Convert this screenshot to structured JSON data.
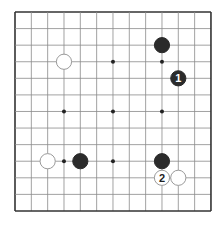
{
  "board": {
    "size": 13,
    "origin_x": 15,
    "origin_y": 12,
    "spacing_x": 16.33,
    "spacing_y": 16.58,
    "line_color": "#8a8a8a",
    "border_color": "#333333",
    "star_points": [
      [
        3,
        3
      ],
      [
        6,
        3
      ],
      [
        9,
        3
      ],
      [
        3,
        6
      ],
      [
        6,
        6
      ],
      [
        9,
        6
      ],
      [
        3,
        9
      ],
      [
        6,
        9
      ],
      [
        9,
        9
      ]
    ]
  },
  "stones": [
    {
      "color": "black",
      "col": 9,
      "row": 2,
      "label": ""
    },
    {
      "color": "black",
      "col": 10,
      "row": 4,
      "label": "1"
    },
    {
      "color": "white",
      "col": 3,
      "row": 3,
      "label": ""
    },
    {
      "color": "white",
      "col": 2,
      "row": 9,
      "label": ""
    },
    {
      "color": "black",
      "col": 4,
      "row": 9,
      "label": ""
    },
    {
      "color": "black",
      "col": 9,
      "row": 9,
      "label": ""
    },
    {
      "color": "white",
      "col": 9,
      "row": 10,
      "label": "2"
    },
    {
      "color": "white",
      "col": 10,
      "row": 10,
      "label": ""
    }
  ],
  "colors": {
    "black_stone": "#2b2b2b",
    "white_stone": "#ffffff",
    "white_stone_border": "#9a9a9a"
  }
}
